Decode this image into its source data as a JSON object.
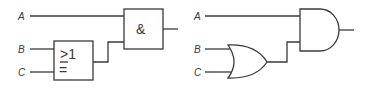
{
  "left_circuit": {
    "notation": "IEC rectangular",
    "inputs": [
      {
        "label": "A"
      },
      {
        "label": "B"
      },
      {
        "label": "C"
      }
    ],
    "or_gate": {
      "symbol_top": "≥1"
    },
    "and_gate": {
      "symbol": "&"
    }
  },
  "right_circuit": {
    "notation": "ANSI distinctive-shape",
    "inputs": [
      {
        "label": "A"
      },
      {
        "label": "B"
      },
      {
        "label": "C"
      }
    ]
  },
  "colors": {
    "stroke": "#3a3a3a",
    "background": "#ffffff"
  }
}
